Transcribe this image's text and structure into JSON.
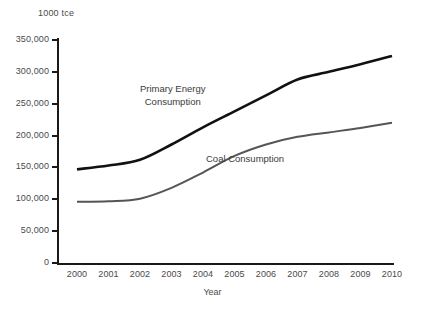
{
  "chart_data": {
    "type": "line",
    "title": "",
    "unit_label": "1000 tce",
    "xlabel": "Year",
    "ylabel": "",
    "x": [
      2000,
      2001,
      2002,
      2003,
      2004,
      2005,
      2006,
      2007,
      2008,
      2009,
      2010
    ],
    "categories": [
      "2000",
      "2001",
      "2002",
      "2003",
      "2004",
      "2005",
      "2006",
      "2007",
      "2008",
      "2009",
      "2010"
    ],
    "xlim": [
      2000,
      2010
    ],
    "ylim": [
      0,
      350000
    ],
    "ytick_labels": [
      "0",
      "50,000",
      "100,000",
      "150,000",
      "200,000",
      "250,000",
      "300,000",
      "350,000"
    ],
    "ytick_values": [
      0,
      50000,
      100000,
      150000,
      200000,
      250000,
      300000,
      350000
    ],
    "grid": false,
    "legend": "inline-annotations",
    "series": [
      {
        "name": "Primary Energy Consumption",
        "color": "#111111",
        "width": 2.6,
        "values": [
          147000,
          153000,
          162000,
          186000,
          213000,
          238000,
          263000,
          288000,
          300000,
          312000,
          325000
        ]
      },
      {
        "name": "Coal Consumption",
        "color": "#555555",
        "width": 2.0,
        "values": [
          96000,
          97000,
          101000,
          118000,
          142000,
          168000,
          186000,
          198000,
          205000,
          212000,
          220000
        ]
      }
    ],
    "annotations": [
      {
        "text": "Primary Energy",
        "series": "Primary Energy Consumption"
      },
      {
        "text": "Consumption",
        "series": "Primary Energy Consumption"
      },
      {
        "text": "Coal Consumption",
        "series": "Coal Consumption"
      }
    ]
  },
  "labels": {
    "unit": "1000 tce",
    "x_axis_title": "Year",
    "annot_primary_line1": "Primary Energy",
    "annot_primary_line2": "Consumption",
    "annot_coal": "Coal Consumption"
  }
}
